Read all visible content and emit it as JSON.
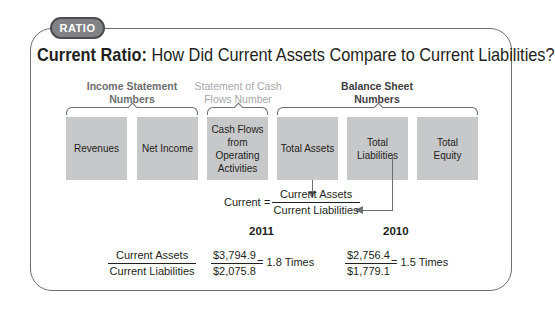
{
  "badge": {
    "label": "RATIO"
  },
  "title": {
    "bold": "Current Ratio:",
    "rest": " How Did Current Assets Compare to Current Liabilities?"
  },
  "groups": [
    {
      "label_line1": "Income Statement",
      "label_line2": "Numbers",
      "color": "#6d6e70"
    },
    {
      "label_line1": "Statement of Cash",
      "label_line2": "Flows Number",
      "color": "#a7a9ac"
    },
    {
      "label_line1": "Balance Sheet",
      "label_line2": "Numbers",
      "color": "#414042"
    }
  ],
  "boxes": [
    {
      "line1": "Revenues",
      "line2": "",
      "line3": "",
      "line4": ""
    },
    {
      "line1": "Net Income",
      "line2": "",
      "line3": "",
      "line4": ""
    },
    {
      "line1": "Cash Flows",
      "line2": "from",
      "line3": "Operating",
      "line4": "Activities"
    },
    {
      "line1": "Total Assets",
      "line2": "",
      "line3": "",
      "line4": ""
    },
    {
      "line1": "Total",
      "line2": "Liabilities",
      "line3": "",
      "line4": ""
    },
    {
      "line1": "Total",
      "line2": "Equity",
      "line3": "",
      "line4": ""
    }
  ],
  "formula": {
    "lhs": "Current",
    "equals": "=",
    "numerator": "Current Assets",
    "denominator": "Current Liabilities"
  },
  "years": [
    "2011",
    "2010"
  ],
  "calculation": {
    "label_numerator": "Current Assets",
    "label_denominator": "Current Liabilities",
    "y2011": {
      "numerator": "$3,794.9",
      "denominator": "$2,075.8",
      "result": "= 1.8 Times"
    },
    "y2010": {
      "numerator": "$2,756.4",
      "denominator": "$1,779.1",
      "result": "= 1.5 Times"
    }
  },
  "colors": {
    "box_fill": "#c7c8ca",
    "line": "#6d6e70",
    "badge_fill": "#808285"
  }
}
